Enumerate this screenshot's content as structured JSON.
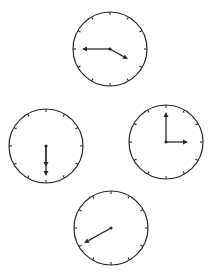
{
  "diagram": {
    "type": "analog-clocks",
    "background": "#ffffff",
    "stroke_color": "#2a2a2a",
    "clocks": [
      {
        "id": "top",
        "center": [
          110,
          49
        ],
        "radius": 37,
        "time_shown": "3:45",
        "hands": [
          {
            "name": "minute-hand",
            "to": [
              82,
              49
            ]
          },
          {
            "name": "hour-hand",
            "to": [
              128,
              59
            ]
          }
        ]
      },
      {
        "id": "left",
        "center": [
          46,
          146
        ],
        "radius": 37,
        "time_shown": "6:30",
        "hands": [
          {
            "name": "hour-hand",
            "to": [
              46,
              167
            ]
          },
          {
            "name": "minute-hand",
            "to": [
              46,
              176
            ]
          }
        ]
      },
      {
        "id": "right",
        "center": [
          166,
          142
        ],
        "radius": 37,
        "time_shown": "3:00",
        "hands": [
          {
            "name": "minute-hand",
            "to": [
              166,
              112
            ]
          },
          {
            "name": "hour-hand",
            "to": [
              188,
              142
            ]
          }
        ]
      },
      {
        "id": "bottom",
        "center": [
          111,
          228
        ],
        "radius": 37,
        "time_shown": "",
        "hands": [
          {
            "name": "hand",
            "to": [
              84,
              243
            ]
          }
        ]
      }
    ]
  }
}
